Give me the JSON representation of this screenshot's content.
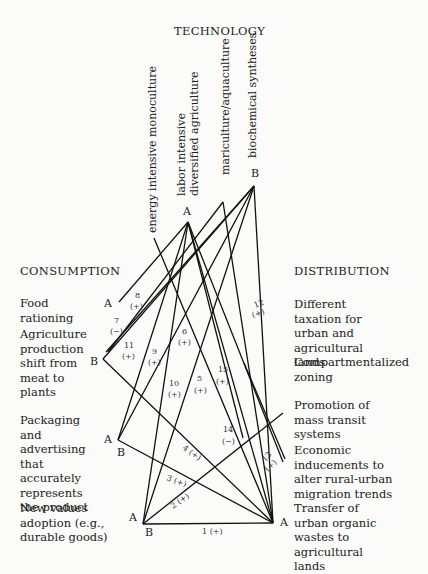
{
  "technology": {
    "heading": "TECHNOLOGY",
    "items": [
      {
        "label": "energy intensive monoculture"
      },
      {
        "label": "labor intensive"
      },
      {
        "label": "diversified agriculture"
      },
      {
        "label": "mariculture/aquaculture"
      },
      {
        "label": "biochemical syntheses"
      }
    ],
    "nodes": {
      "labor": "A",
      "biochemical": "B"
    }
  },
  "consumption": {
    "heading": "CONSUMPTION",
    "items": [
      {
        "label": "Food rationing",
        "node": "A"
      },
      {
        "label": "Agriculture production shift from meat to plants",
        "node": "B"
      },
      {
        "label": "Packaging and advertising that accurately represents the product",
        "node_a": "A",
        "node_b": "B"
      },
      {
        "label": "New values adoption (e.g., durable goods)",
        "node_a": "A",
        "node_b": "B"
      }
    ]
  },
  "distribution": {
    "heading": "DISTRIBUTION",
    "items": [
      {
        "label": "Different taxation for urban and agricultural lands"
      },
      {
        "label": "Compartmentalized zoning"
      },
      {
        "label": "Promotion of mass transit systems"
      },
      {
        "label": "Economic inducements to alter rural-urban migration trends"
      },
      {
        "label": "Transfer of urban organic wastes to agricultural lands",
        "node": "A"
      }
    ]
  },
  "links": [
    {
      "id": "1",
      "sign": "(+)"
    },
    {
      "id": "2",
      "sign": "(+)"
    },
    {
      "id": "3",
      "sign": "(+)"
    },
    {
      "id": "4",
      "sign": "(+)"
    },
    {
      "id": "5",
      "sign": "(+)"
    },
    {
      "id": "6",
      "sign": "(+)"
    },
    {
      "id": "7",
      "sign": "(−)"
    },
    {
      "id": "8",
      "sign": "(+)"
    },
    {
      "id": "9",
      "sign": "(+)"
    },
    {
      "id": "10",
      "sign": "(+)"
    },
    {
      "id": "11",
      "sign": "(+)"
    },
    {
      "id": "12",
      "sign": "(+)"
    },
    {
      "id": "13",
      "sign": "(+)"
    },
    {
      "id": "14",
      "sign": "(−)"
    },
    {
      "id": "15",
      "sign": "(+)"
    }
  ]
}
